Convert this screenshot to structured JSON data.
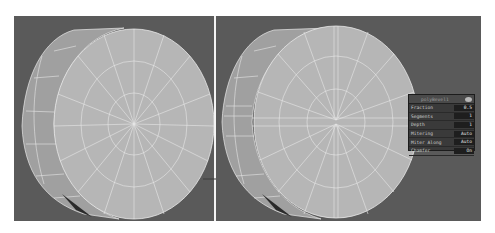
{
  "viewports": {
    "left": {
      "label": "before"
    },
    "right": {
      "label": "after"
    }
  },
  "inline_panel": {
    "title": "polyBevel1",
    "rows": [
      {
        "label": "Fraction",
        "value": "0.5"
      },
      {
        "label": "Segments",
        "value": "1"
      },
      {
        "label": "Depth",
        "value": "1"
      },
      {
        "label": "Mitering",
        "value": "Auto"
      },
      {
        "label": "Miter Along",
        "value": "Auto"
      },
      {
        "label": "Chamfer",
        "value": "On"
      }
    ]
  },
  "colors": {
    "viewport_bg": "#5a5a5a",
    "mesh_face": "#b4b4b4",
    "mesh_side": "#9c9c9c",
    "wire": "#e8e8e8",
    "divider": "#f4f4f4"
  }
}
